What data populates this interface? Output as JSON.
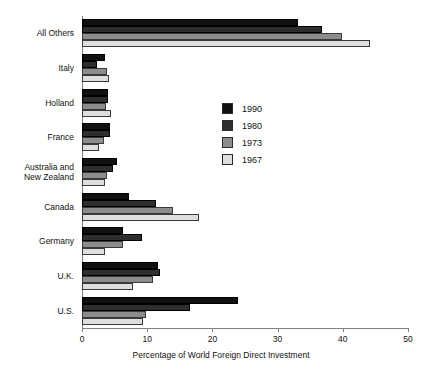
{
  "chart_data": {
    "type": "bar",
    "orientation": "horizontal",
    "title": "",
    "xlabel": "Percentage of World Foreign Direct Investment",
    "ylabel": "",
    "xlim": [
      0,
      50
    ],
    "xticks": [
      0,
      10,
      20,
      30,
      40,
      50
    ],
    "grid": false,
    "legend_position": "center-right-inside",
    "categories": [
      "All Others",
      "Italy",
      "Holland",
      "France",
      "Australia and\nNew Zealand",
      "Canada",
      "Germany",
      "U.K.",
      "U.S."
    ],
    "series": [
      {
        "name": "1990",
        "color": "#111111",
        "values": [
          33.1,
          3.5,
          4.0,
          4.3,
          5.4,
          7.2,
          6.3,
          11.7,
          23.9
        ]
      },
      {
        "name": "1980",
        "color": "#2e2e2e",
        "values": [
          36.8,
          2.3,
          4.0,
          4.3,
          4.8,
          11.3,
          9.2,
          12.0,
          16.6
        ]
      },
      {
        "name": "1973",
        "color": "#8c8c8c",
        "values": [
          39.9,
          3.8,
          3.7,
          3.4,
          3.8,
          14.0,
          6.3,
          10.9,
          9.8
        ]
      },
      {
        "name": "1967",
        "color": "#dedede",
        "values": [
          44.2,
          4.1,
          4.4,
          2.6,
          3.5,
          17.9,
          3.6,
          7.8,
          9.4
        ]
      }
    ]
  },
  "legend": {
    "items": [
      {
        "label": "1990"
      },
      {
        "label": "1980"
      },
      {
        "label": "1973"
      },
      {
        "label": "1967"
      }
    ]
  },
  "axis": {
    "x_title": "Percentage of World Foreign Direct Investment",
    "x_tick_labels": [
      "0",
      "10",
      "20",
      "30",
      "40",
      "50"
    ]
  }
}
